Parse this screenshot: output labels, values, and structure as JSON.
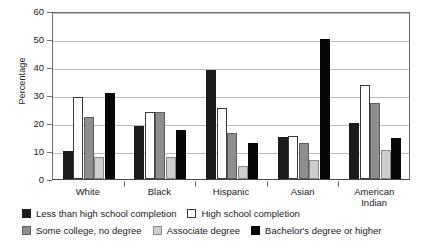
{
  "chart_data": {
    "type": "bar",
    "title": "",
    "xlabel": "",
    "ylabel": "Percentage",
    "ylim": [
      0,
      60
    ],
    "yticks": [
      0,
      10,
      20,
      30,
      40,
      50,
      60
    ],
    "grid": true,
    "legend_position": "bottom",
    "categories": [
      "White",
      "Black",
      "Hispanic",
      "Asian",
      "American Indian"
    ],
    "category_lines": [
      [
        "White"
      ],
      [
        "Black"
      ],
      [
        "Hispanic"
      ],
      [
        "Asian"
      ],
      [
        "American",
        "Indian"
      ]
    ],
    "series": [
      {
        "name": "Less than high school completion",
        "color": "#1c1c1c",
        "values": [
          10.0,
          18.8,
          39.1,
          14.9,
          20.0
        ]
      },
      {
        "name": "High school completion",
        "color": "#ffffff",
        "values": [
          29.2,
          24.0,
          25.5,
          15.5,
          33.5
        ]
      },
      {
        "name": "Some college, no degree",
        "color": "#8e8e8e",
        "values": [
          22.0,
          24.1,
          16.6,
          12.7,
          27.1
        ]
      },
      {
        "name": "Associate degree",
        "color": "#cdcdcd",
        "values": [
          7.8,
          7.7,
          4.8,
          6.7,
          10.3
        ]
      },
      {
        "name": "Bachelor's degree or higher",
        "color": "#070707",
        "values": [
          30.6,
          17.4,
          12.8,
          49.9,
          14.8
        ]
      }
    ]
  },
  "legend": {
    "row1": [
      {
        "label": "Less than high school completion",
        "swatch": "#1c1c1c",
        "border": "#1c1c1c"
      },
      {
        "label": "High school completion",
        "swatch": "#ffffff",
        "border": "#3a3a3a"
      }
    ],
    "row2": [
      {
        "label": "Some college, no degree",
        "swatch": "#8e8e8e",
        "border": "#5c5c5c"
      },
      {
        "label": "Associate degree",
        "swatch": "#cdcdcd",
        "border": "#8a8a8a"
      },
      {
        "label": "Bachelor's degree or higher",
        "swatch": "#070707",
        "border": "#070707"
      }
    ]
  }
}
